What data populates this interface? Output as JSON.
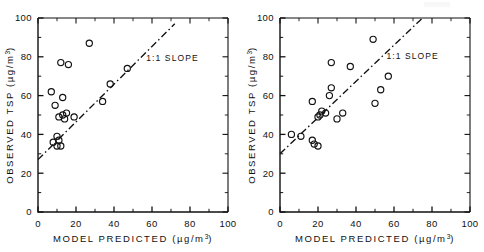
{
  "figure": {
    "background": "#ffffff",
    "ink_color": "#111111",
    "panel_count": 2
  },
  "chart_data": [
    {
      "panel": "left",
      "type": "scatter",
      "title": "",
      "xlabel": "MODEL PREDICTED  (µg/m³)",
      "ylabel": "OBSERVED TSP  (µg/m³)",
      "xlim": [
        0,
        100
      ],
      "ylim": [
        0,
        100
      ],
      "xticks": [
        0,
        20,
        40,
        60,
        80,
        100
      ],
      "yticks": [
        0,
        20,
        40,
        60,
        80,
        100
      ],
      "xtick_labels": [
        "0",
        "20",
        "40",
        "60",
        "80",
        "100"
      ],
      "ytick_labels": [
        "0",
        "20",
        "40",
        "60",
        "80",
        "100"
      ],
      "minor_tick_interval": 10,
      "grid": false,
      "legend": null,
      "marker": "open-circle",
      "annotations": [
        {
          "text": "1:1 SLOPE",
          "x": 57,
          "y": 78
        }
      ],
      "reference_line": {
        "label": "1:1 SLOPE",
        "style": "dash-dot",
        "x": [
          0,
          72
        ],
        "y": [
          27,
          97
        ]
      },
      "points": [
        {
          "x": 27,
          "y": 87
        },
        {
          "x": 12,
          "y": 77
        },
        {
          "x": 16,
          "y": 76
        },
        {
          "x": 47,
          "y": 74
        },
        {
          "x": 38,
          "y": 66
        },
        {
          "x": 7,
          "y": 62
        },
        {
          "x": 13,
          "y": 59
        },
        {
          "x": 34,
          "y": 57
        },
        {
          "x": 9,
          "y": 55
        },
        {
          "x": 15,
          "y": 51
        },
        {
          "x": 13,
          "y": 50
        },
        {
          "x": 11,
          "y": 49
        },
        {
          "x": 19,
          "y": 49
        },
        {
          "x": 14,
          "y": 48
        },
        {
          "x": 10,
          "y": 39
        },
        {
          "x": 11,
          "y": 37
        },
        {
          "x": 8,
          "y": 36
        },
        {
          "x": 10,
          "y": 34
        },
        {
          "x": 12,
          "y": 34
        }
      ]
    },
    {
      "panel": "right",
      "type": "scatter",
      "title": "",
      "xlabel": "MODEL PREDICTED  (µg/m³)",
      "ylabel": "OBSERVED TSP  (µg/m³)",
      "xlim": [
        0,
        100
      ],
      "ylim": [
        0,
        100
      ],
      "xticks": [
        0,
        20,
        40,
        60,
        80,
        100
      ],
      "yticks": [
        0,
        20,
        40,
        60,
        80,
        100
      ],
      "xtick_labels": [
        "0",
        "20",
        "40",
        "60",
        "80",
        "100"
      ],
      "ytick_labels": [
        "0",
        "20",
        "40",
        "60",
        "80",
        "100"
      ],
      "minor_tick_interval": 10,
      "grid": false,
      "legend": null,
      "marker": "open-circle",
      "annotations": [
        {
          "text": "1:1 SLOPE",
          "x": 56,
          "y": 79
        }
      ],
      "reference_line": {
        "label": "1:1 SLOPE",
        "style": "dash-dot",
        "x": [
          0,
          75
        ],
        "y": [
          30,
          100
        ]
      },
      "points": [
        {
          "x": 49,
          "y": 89
        },
        {
          "x": 27,
          "y": 77
        },
        {
          "x": 37,
          "y": 75
        },
        {
          "x": 57,
          "y": 70
        },
        {
          "x": 27,
          "y": 64
        },
        {
          "x": 53,
          "y": 63
        },
        {
          "x": 26,
          "y": 60
        },
        {
          "x": 17,
          "y": 57
        },
        {
          "x": 50,
          "y": 56
        },
        {
          "x": 33,
          "y": 51
        },
        {
          "x": 22,
          "y": 52
        },
        {
          "x": 24,
          "y": 51
        },
        {
          "x": 21,
          "y": 50
        },
        {
          "x": 20,
          "y": 49
        },
        {
          "x": 30,
          "y": 48
        },
        {
          "x": 6,
          "y": 40
        },
        {
          "x": 11,
          "y": 39
        },
        {
          "x": 17,
          "y": 37
        },
        {
          "x": 18,
          "y": 35
        },
        {
          "x": 20,
          "y": 34
        }
      ]
    }
  ]
}
